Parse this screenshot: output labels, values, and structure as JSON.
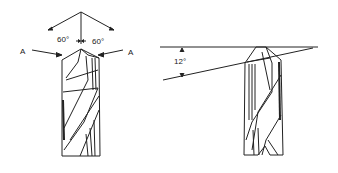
{
  "diagram": {
    "left_view": {
      "angle_left": "60°",
      "angle_right": "60°",
      "arrow_label_left": "A",
      "arrow_label_right": "A"
    },
    "right_view": {
      "clearance_angle": "12°"
    }
  }
}
